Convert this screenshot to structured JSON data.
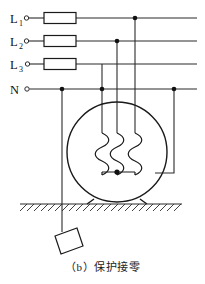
{
  "figure": {
    "caption": "（b）保护接零",
    "caption_label": "(b)",
    "caption_text": "保护接零",
    "diagram_type": "electrical-schematic",
    "colors": {
      "line": "#1a1a1a",
      "wire": "#2b2b2b",
      "background": "#ffffff"
    }
  },
  "supply_lines": [
    {
      "id": "L1",
      "label": "L",
      "subscript": "1",
      "y": 18,
      "has_fuse": true,
      "terminal": "open-circle"
    },
    {
      "id": "L2",
      "label": "L",
      "subscript": "2",
      "y": 41,
      "has_fuse": true,
      "terminal": "open-circle"
    },
    {
      "id": "L3",
      "label": "L",
      "subscript": "3",
      "y": 64,
      "has_fuse": true,
      "terminal": "open-circle"
    },
    {
      "id": "N",
      "label": "N",
      "subscript": "",
      "y": 89,
      "has_fuse": false,
      "terminal": "open-circle"
    }
  ],
  "fuses": {
    "count": 3,
    "symbol_name": "fuse-rectangle",
    "x": 44,
    "width": 32,
    "height": 11
  },
  "junction_dots": [
    {
      "name": "dot-L1-drop",
      "x": 135,
      "y": 18
    },
    {
      "name": "dot-L2-drop",
      "x": 117,
      "y": 41
    },
    {
      "name": "dot-N-ground-drop",
      "x": 62,
      "y": 89
    },
    {
      "name": "dot-N-star-drop",
      "x": 102,
      "y": 89
    },
    {
      "name": "dot-N-frame-bond",
      "x": 174,
      "y": 89
    },
    {
      "name": "dot-star-point",
      "x": 117,
      "y": 172
    }
  ],
  "motor": {
    "name": "three-phase-motor",
    "center_x": 117,
    "center_y": 152,
    "radius": 50,
    "winding_count": 3,
    "winding_connection": "star",
    "feet": 2
  },
  "ground": {
    "name": "earth-hatching",
    "line_y": 204,
    "line_x_start": 20,
    "line_x_end": 182,
    "hatch_count": 22
  },
  "ground_electrode": {
    "name": "grounding-plate",
    "shape": "parallelogram",
    "x": 55,
    "y": 228,
    "width": 28,
    "height": 26
  },
  "connections": [
    {
      "from": "L1",
      "to": "motor-winding-3",
      "drop_x": 135
    },
    {
      "from": "L2",
      "to": "motor-winding-2",
      "drop_x": 117
    },
    {
      "from": "L3",
      "to": "motor-winding-1",
      "drop_x": 102
    },
    {
      "from": "N",
      "to": "earth-electrode",
      "drop_x": 62
    },
    {
      "from": "N",
      "to": "motor-frame",
      "drop_x": 174
    }
  ]
}
